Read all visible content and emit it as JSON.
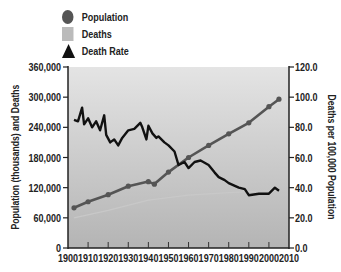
{
  "legend": {
    "items": [
      {
        "label": "Population",
        "marker": "circle",
        "color": "#555555"
      },
      {
        "label": "Deaths",
        "marker": "square",
        "color": "#bbbbbb"
      },
      {
        "label": "Death Rate",
        "marker": "triangle",
        "color": "#111111"
      }
    ]
  },
  "axes": {
    "left_title": "Population (thousands) and Deaths",
    "right_title": "Deaths per 100,000 Population",
    "left_ticks": [
      "0",
      "60,000",
      "120,000",
      "180,000",
      "240,000",
      "300,000",
      "360,000"
    ],
    "right_ticks": [
      "0.0",
      "20.0",
      "40.0",
      "60.0",
      "80.0",
      "100.0",
      "120.0"
    ],
    "x_ticks": [
      "1900",
      "1910",
      "1920",
      "1930",
      "1940",
      "1950",
      "1960",
      "1970",
      "1980",
      "1990",
      "2000",
      "2010"
    ]
  },
  "chart_data": {
    "type": "line",
    "title": "",
    "xlabel": "",
    "ylabel": "Population (thousands) and Deaths",
    "y2label": "Deaths per 100,000 Population",
    "xlim": [
      1900,
      2010
    ],
    "ylim": [
      0,
      360000
    ],
    "y2lim": [
      0,
      120
    ],
    "grid": false,
    "legend_position": "top-left",
    "series": [
      {
        "name": "Population",
        "axis": "left",
        "color": "#555555",
        "x": [
          1903,
          1910,
          1920,
          1930,
          1940,
          1943,
          1950,
          1960,
          1970,
          1980,
          1990,
          2000,
          2005
        ],
        "values": [
          80000,
          92000,
          106000,
          123000,
          132000,
          127000,
          151000,
          180000,
          204000,
          227000,
          249000,
          281000,
          296000
        ]
      },
      {
        "name": "Deaths",
        "axis": "left",
        "color": "#c8c8c8",
        "x": [
          1903,
          1920,
          1940,
          1960,
          1980,
          2005
        ],
        "values": [
          60000,
          75000,
          95000,
          105000,
          110000,
          115000
        ]
      },
      {
        "name": "Death Rate",
        "axis": "right",
        "color": "#111111",
        "x": [
          1903,
          1905,
          1907,
          1908,
          1910,
          1912,
          1914,
          1916,
          1918,
          1919,
          1921,
          1923,
          1925,
          1927,
          1930,
          1933,
          1936,
          1937,
          1939,
          1940,
          1942,
          1944,
          1945,
          1948,
          1950,
          1953,
          1955,
          1958,
          1960,
          1963,
          1966,
          1970,
          1973,
          1975,
          1978,
          1980,
          1985,
          1988,
          1990,
          1995,
          2000,
          2003,
          2005
        ],
        "values": [
          85,
          84,
          93,
          82,
          86,
          80,
          84,
          78,
          88,
          75,
          70,
          72,
          68,
          73,
          78,
          79,
          83,
          80,
          72,
          81,
          76,
          73,
          74,
          70,
          68,
          64,
          55,
          57,
          53,
          57,
          58,
          55,
          50,
          47,
          45,
          43,
          40,
          39,
          35,
          36,
          36,
          40,
          38
        ]
      }
    ]
  }
}
